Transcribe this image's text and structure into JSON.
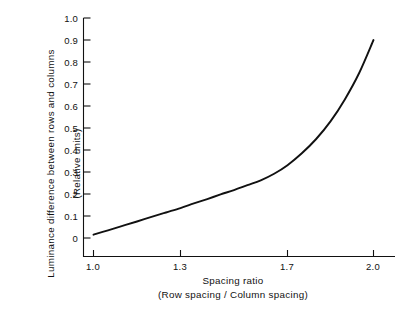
{
  "figure": {
    "background_color": "#ffffff",
    "line_color": "#111111"
  },
  "chart_data": {
    "type": "line",
    "title": "",
    "subtitle": "",
    "xlabel": "Spacing ratio",
    "xlabel_sub": "(Row spacing / Column spacing)",
    "ylabel": "Luminance difference between rows and columns",
    "ylabel_sub": "(Relative units)",
    "xlim": [
      0.95,
      2.05
    ],
    "ylim": [
      -0.04,
      1.03
    ],
    "grid": false,
    "legend": "none",
    "x_ticks": [
      "1.0",
      "1.3",
      "1.7",
      "2.0"
    ],
    "x_tick_values": [
      1.0,
      1.3,
      1.7,
      2.0
    ],
    "y_ticks": [
      "0",
      "0.1",
      "0.2",
      "0.3",
      "0.4",
      "0.5",
      "0.6",
      "0.7",
      "0.8",
      "0.9",
      "1.0"
    ],
    "y_tick_values": [
      0,
      0.1,
      0.2,
      0.3,
      0.4,
      0.5,
      0.6,
      0.7,
      0.8,
      0.9,
      1.0
    ],
    "series": [
      {
        "name": "luminance-difference-curve",
        "x": [
          1.0,
          1.05,
          1.1,
          1.15,
          1.2,
          1.25,
          1.3,
          1.35,
          1.4,
          1.45,
          1.5,
          1.55,
          1.6,
          1.65,
          1.7,
          1.75,
          1.8,
          1.85,
          1.9,
          1.95,
          2.0
        ],
        "y": [
          0.015,
          0.035,
          0.055,
          0.075,
          0.096,
          0.116,
          0.136,
          0.157,
          0.177,
          0.198,
          0.218,
          0.24,
          0.262,
          0.292,
          0.331,
          0.385,
          0.45,
          0.53,
          0.63,
          0.75,
          0.9
        ]
      }
    ]
  }
}
